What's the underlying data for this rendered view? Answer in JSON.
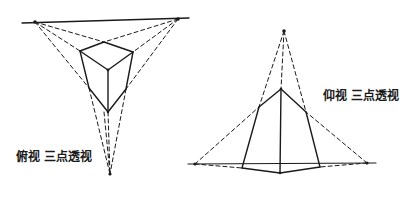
{
  "diagrams": [
    {
      "id": "birds-eye",
      "caption": "俯视 三点透视",
      "horizon_line": {
        "x1": 22,
        "y1": 23,
        "x2": 189,
        "y2": 18
      },
      "vanishing_points": [
        {
          "name": "left",
          "x": 35,
          "y": 22
        },
        {
          "name": "right",
          "x": 178,
          "y": 19
        },
        {
          "name": "bottom",
          "x": 110,
          "y": 174
        }
      ],
      "box_vertices": {
        "top_back": [
          104,
          42
        ],
        "top_left": [
          80,
          51
        ],
        "top_right": [
          133,
          52
        ],
        "top_front": [
          108,
          70
        ],
        "bottom_left": [
          89,
          88
        ],
        "bottom_right": [
          126,
          89
        ],
        "bottom_front": [
          108,
          112
        ]
      }
    },
    {
      "id": "worms-eye",
      "caption": "仰视 三点透视",
      "horizon_line": {
        "x1": 188,
        "y1": 164,
        "x2": 376,
        "y2": 163
      },
      "vanishing_points": [
        {
          "name": "left",
          "x": 195,
          "y": 164
        },
        {
          "name": "right",
          "x": 367,
          "y": 163
        },
        {
          "name": "top",
          "x": 284,
          "y": 31
        }
      ],
      "box_vertices": {
        "top_front": [
          281,
          89
        ],
        "top_left": [
          259,
          107
        ],
        "top_right": [
          306,
          112
        ],
        "bottom_left": [
          242,
          168
        ],
        "bottom_right": [
          320,
          167
        ],
        "bottom_front": [
          280,
          173
        ]
      }
    }
  ],
  "colors": {
    "ink": "#1a1a1a",
    "background": "#ffffff"
  }
}
